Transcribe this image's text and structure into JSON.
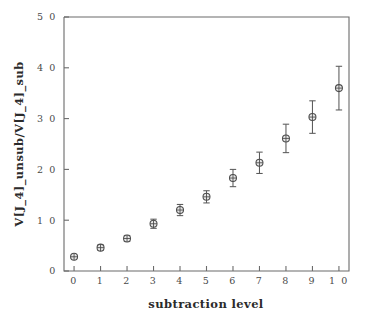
{
  "chart_data": {
    "type": "scatter",
    "title": "",
    "xlabel": "subtraction level",
    "ylabel": "V[J_4]_unsub/V[J_4]_sub",
    "xlim": [
      -0.38,
      10.38
    ],
    "ylim": [
      0.0,
      5.0
    ],
    "xticks": [
      0,
      1,
      2,
      3,
      4,
      5,
      6,
      7,
      8,
      9,
      10
    ],
    "xticklabels": [
      "0",
      "1",
      "2",
      "3",
      "4",
      "5",
      "6",
      "7",
      "8",
      "9",
      "1 0"
    ],
    "yticks": [
      0.0,
      1.0,
      2.0,
      3.0,
      4.0,
      5.0
    ],
    "yticklabels": [
      "0",
      "1 0",
      "2 0",
      "3 0",
      "4 0",
      "5 0"
    ],
    "grid": false,
    "legend": false,
    "marker": "circle-with-cross",
    "marker_color": "#4d4d4d",
    "errorbar_color": "#5a5a5a",
    "axis_color": "#6b6b6b",
    "background": "#ffffff",
    "x": [
      0,
      1,
      2,
      3,
      4,
      5,
      6,
      7,
      8,
      9,
      10
    ],
    "y": [
      0.28,
      0.46,
      0.64,
      0.93,
      1.2,
      1.46,
      1.83,
      2.13,
      2.61,
      3.03,
      3.6
    ],
    "yerr": [
      0.03,
      0.05,
      0.06,
      0.09,
      0.11,
      0.12,
      0.17,
      0.21,
      0.28,
      0.32,
      0.43
    ],
    "series": [
      {
        "name": "V[J_4]_unsub/V[J_4]_sub",
        "points": [
          {
            "x": 0,
            "y": 0.28,
            "err": 0.03
          },
          {
            "x": 1,
            "y": 0.46,
            "err": 0.05
          },
          {
            "x": 2,
            "y": 0.64,
            "err": 0.06
          },
          {
            "x": 3,
            "y": 0.93,
            "err": 0.09
          },
          {
            "x": 4,
            "y": 1.2,
            "err": 0.11
          },
          {
            "x": 5,
            "y": 1.46,
            "err": 0.12
          },
          {
            "x": 6,
            "y": 1.83,
            "err": 0.17
          },
          {
            "x": 7,
            "y": 2.13,
            "err": 0.21
          },
          {
            "x": 8,
            "y": 2.61,
            "err": 0.28
          },
          {
            "x": 9,
            "y": 3.03,
            "err": 0.32
          },
          {
            "x": 10,
            "y": 3.6,
            "err": 0.43
          }
        ]
      }
    ]
  }
}
